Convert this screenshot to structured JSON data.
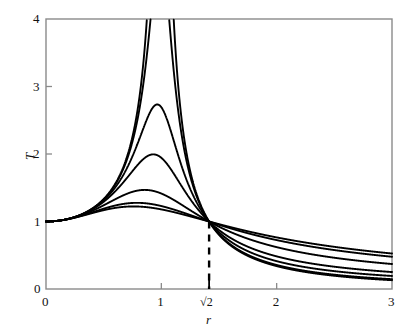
{
  "chart_data": {
    "type": "line",
    "title": "",
    "subtitle": "",
    "xlabel": "r",
    "ylabel": "T",
    "xlim": [
      0,
      3
    ],
    "ylim": [
      0,
      4
    ],
    "grid": false,
    "legend": "none",
    "xticks": [
      {
        "value": 0,
        "label": "0"
      },
      {
        "value": 1,
        "label": "1"
      },
      {
        "value": 1.41421356,
        "label": "√2"
      },
      {
        "value": 2,
        "label": "2"
      },
      {
        "value": 3,
        "label": "3"
      }
    ],
    "yticks": [
      {
        "value": 0,
        "label": "0"
      },
      {
        "value": 1,
        "label": "1"
      },
      {
        "value": 2,
        "label": "2"
      },
      {
        "value": 3,
        "label": "3"
      },
      {
        "value": 4,
        "label": "4"
      }
    ],
    "annotations": [
      {
        "name": "crossover-dashed-line",
        "kind": "vertical-dashed",
        "x": 1.41421356,
        "y_from": 0,
        "y_to": 1
      }
    ],
    "common_point": {
      "x": 1.41421356,
      "y": 1
    },
    "series": [
      {
        "name": "zeta-0.05",
        "zeta": 0.05,
        "peak_x": 1.0,
        "peak_y": 10.0,
        "value_at_r3": 0.125,
        "clipped_at_top": true
      },
      {
        "name": "zeta-0.10",
        "zeta": 0.1,
        "peak_x": 1.0,
        "peak_y": 5.03,
        "value_at_r3": 0.135,
        "clipped_at_top": true
      },
      {
        "name": "zeta-0.20",
        "zeta": 0.2,
        "peak_x": 0.96,
        "peak_y": 2.74,
        "value_at_r3": 0.17,
        "clipped_at_top": false
      },
      {
        "name": "zeta-0.30",
        "zeta": 0.3,
        "peak_x": 0.92,
        "peak_y": 2.03,
        "value_at_r3": 0.23,
        "clipped_at_top": false
      },
      {
        "name": "zeta-0.50",
        "zeta": 0.5,
        "peak_x": 0.82,
        "peak_y": 1.44,
        "value_at_r3": 0.36,
        "clipped_at_top": false
      },
      {
        "name": "zeta-0.70",
        "zeta": 0.7,
        "peak_x": 0.7,
        "peak_y": 1.24,
        "value_at_r3": 0.5,
        "clipped_at_top": false
      },
      {
        "name": "zeta-0.80",
        "zeta": 0.8,
        "peak_x": 0.62,
        "peak_y": 1.21,
        "value_at_r3": 0.56,
        "clipped_at_top": false
      }
    ],
    "colors": {
      "line": "#000000",
      "axis": "#777777",
      "background": "#ffffff",
      "dashed": "#000000"
    }
  },
  "axes": {
    "x_title": "r",
    "y_title": "T"
  }
}
